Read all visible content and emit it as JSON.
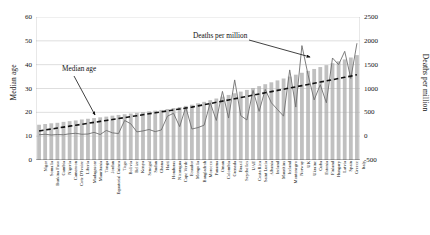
{
  "chart_data": {
    "type": "bar",
    "title": "",
    "subtitle": "",
    "xlabel": "",
    "ylabel": "Median age",
    "y2label": "Deaths per million",
    "grid": true,
    "legend_position": "none",
    "ylim": [
      0,
      60
    ],
    "y2lim": [
      -500,
      2500
    ],
    "yticks": [
      "0",
      "10",
      "20",
      "30",
      "40",
      "50",
      "60"
    ],
    "y2ticks": [
      "-500",
      "0",
      "500",
      "1000",
      "1500",
      "2000",
      "2500"
    ],
    "annotations": [
      {
        "name": "median-age-annotation",
        "text": "Median age",
        "points_to": "bars"
      },
      {
        "name": "deaths-per-million-annotation",
        "text": "Deaths per million",
        "points_to": "line-spike"
      }
    ],
    "categories": [
      "Niger",
      "Somalia",
      "Burkina Faso",
      "Gambia",
      "Nigeria",
      "Cameroon",
      "Cote D'Ivoire",
      "Liberia",
      "Madagascar",
      "Mauritania",
      "Tonga",
      "Jordan",
      "Equatorial Guinea",
      "Togo",
      "Bolivia",
      "Belize",
      "Kenya",
      "Senegal",
      "Sudan",
      "Ghana",
      "Haiti",
      "Honduras",
      "Nicaragua",
      "Cape Verde",
      "Ecuador",
      "Mongolia",
      "Bangladesh",
      "Morocco",
      "Panama",
      "Oman",
      "Colombia",
      "Grenada",
      "Brazil",
      "Seychelles",
      "UAE",
      "Costa Rica",
      "Saint Lucia",
      "Albania",
      "Ireland",
      "Mauritius",
      "Iceland",
      "Montenegro",
      "Norway",
      "UK",
      "Ukraine",
      "Cuba",
      "Estonia",
      "Finland",
      "Hungary",
      "Latvia",
      "Spain",
      "Greece",
      "Italy"
    ],
    "series": [
      {
        "name": "Median age",
        "axis": "left",
        "render": "bar",
        "color": "#a8a8a8",
        "values": [
          14.8,
          15.1,
          15.4,
          15.6,
          16.0,
          16.3,
          16.6,
          17.0,
          17.3,
          17.6,
          17.9,
          18.2,
          18.6,
          18.9,
          19.2,
          19.5,
          19.8,
          20.1,
          20.4,
          20.7,
          21.0,
          21.4,
          21.8,
          22.2,
          22.7,
          23.2,
          23.8,
          24.4,
          25.1,
          25.8,
          26.6,
          27.3,
          28.0,
          28.7,
          29.4,
          30.2,
          31.0,
          31.8,
          32.6,
          33.4,
          34.2,
          35.0,
          35.8,
          36.6,
          37.4,
          38.2,
          39.0,
          39.8,
          40.6,
          41.4,
          42.2,
          43.0,
          44.0
        ]
      },
      {
        "name": "Deaths per million",
        "axis": "right",
        "render": "line",
        "color": "#6f6f6f",
        "values": [
          30,
          40,
          25,
          35,
          30,
          50,
          60,
          40,
          45,
          80,
          35,
          120,
          70,
          55,
          330,
          260,
          90,
          110,
          140,
          95,
          130,
          420,
          480,
          200,
          610,
          150,
          180,
          230,
          700,
          330,
          940,
          380,
          1180,
          430,
          340,
          960,
          520,
          980,
          700,
          560,
          420,
          1390,
          610,
          1900,
          1290,
          760,
          1080,
          700,
          1640,
          1500,
          1780,
          1210,
          1950
        ]
      },
      {
        "name": "Trend",
        "axis": "right",
        "render": "dashed-line",
        "color": "#111111",
        "values": [
          110,
          130,
          150,
          170,
          190,
          210,
          230,
          250,
          270,
          290,
          310,
          330,
          350,
          370,
          390,
          410,
          430,
          450,
          470,
          490,
          510,
          530,
          550,
          570,
          590,
          610,
          635,
          660,
          685,
          710,
          735,
          760,
          785,
          810,
          835,
          860,
          885,
          910,
          935,
          960,
          985,
          1010,
          1035,
          1060,
          1085,
          1110,
          1135,
          1160,
          1185,
          1210,
          1235,
          1260,
          1290
        ]
      }
    ]
  }
}
